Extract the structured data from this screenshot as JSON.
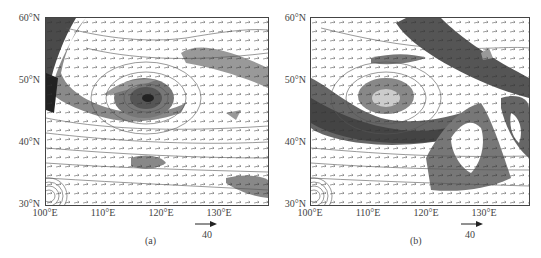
{
  "figure": {
    "panels": [
      {
        "id": "a",
        "caption": "(a)",
        "lat_labels": [
          "60°N",
          "50°N",
          "40°N",
          "30°N"
        ],
        "lon_labels": [
          "100°E",
          "110°E",
          "120°E",
          "130°E"
        ],
        "ref_vector_label": "40"
      },
      {
        "id": "b",
        "caption": "(b)",
        "lat_labels": [
          "60°N",
          "50°N",
          "40°N",
          "30°N"
        ],
        "lon_labels": [
          "100°E",
          "110°E",
          "120°E",
          "130°E"
        ],
        "ref_vector_label": "40"
      }
    ],
    "colors": {
      "shade_dark": "#3a3a3a",
      "shade_mid": "#777777",
      "shade_light": "#b5b5b5",
      "contour": "#555555",
      "vector": "#333333"
    }
  }
}
